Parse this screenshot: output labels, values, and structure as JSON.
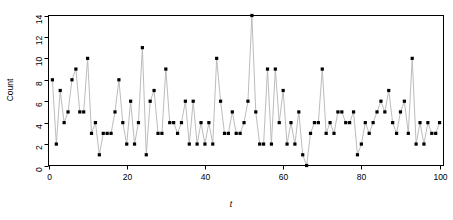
{
  "chart_data": {
    "type": "line",
    "title": "",
    "subtitle": "",
    "xlabel": "t",
    "ylabel": "Count",
    "xlim": [
      0,
      101
    ],
    "ylim": [
      0,
      14
    ],
    "xticks": [
      0,
      20,
      40,
      60,
      80,
      100
    ],
    "yticks": [
      0,
      2,
      4,
      6,
      8,
      10,
      12,
      14
    ],
    "grid": false,
    "legend": null,
    "legend_position": "none",
    "marker": "filled-square",
    "line_color": "#b4b4b4",
    "marker_color": "#000000",
    "axis_color": "#000000",
    "background": "#ffffff",
    "series": [
      {
        "name": "Count",
        "x": [
          1,
          2,
          3,
          4,
          5,
          6,
          7,
          8,
          9,
          10,
          11,
          12,
          13,
          14,
          15,
          16,
          17,
          18,
          19,
          20,
          21,
          22,
          23,
          24,
          25,
          26,
          27,
          28,
          29,
          30,
          31,
          32,
          33,
          34,
          35,
          36,
          37,
          38,
          39,
          40,
          41,
          42,
          43,
          44,
          45,
          46,
          47,
          48,
          49,
          50,
          51,
          52,
          53,
          54,
          55,
          56,
          57,
          58,
          59,
          60,
          61,
          62,
          63,
          64,
          65,
          66,
          67,
          68,
          69,
          70,
          71,
          72,
          73,
          74,
          75,
          76,
          77,
          78,
          79,
          80,
          81,
          82,
          83,
          84,
          85,
          86,
          87,
          88,
          89,
          90,
          91,
          92,
          93,
          94,
          95,
          96,
          97,
          98,
          99,
          100
        ],
        "values": [
          8,
          2,
          7,
          4,
          5,
          8,
          9,
          5,
          5,
          10,
          3,
          4,
          1,
          3,
          3,
          3,
          5,
          8,
          4,
          2,
          6,
          2,
          4,
          11,
          1,
          6,
          7,
          3,
          3,
          9,
          4,
          4,
          3,
          4,
          6,
          2,
          6,
          2,
          4,
          2,
          4,
          2,
          10,
          6,
          3,
          3,
          5,
          3,
          3,
          4,
          6,
          14,
          5,
          2,
          2,
          9,
          2,
          9,
          4,
          7,
          2,
          4,
          2,
          5,
          1,
          0,
          3,
          4,
          4,
          9,
          3,
          4,
          3,
          5,
          5,
          4,
          4,
          5,
          1,
          2,
          4,
          3,
          4,
          5,
          6,
          5,
          7,
          4,
          3,
          5,
          6,
          3,
          10,
          2,
          4,
          2,
          4,
          3,
          3,
          4
        ]
      }
    ]
  },
  "axis": {
    "y_label": "Count",
    "x_label": "t",
    "y_tick_labels": [
      "0",
      "2",
      "4",
      "6",
      "8",
      "10",
      "12",
      "14"
    ],
    "x_tick_labels": [
      "0",
      "20",
      "40",
      "60",
      "80",
      "100"
    ]
  }
}
